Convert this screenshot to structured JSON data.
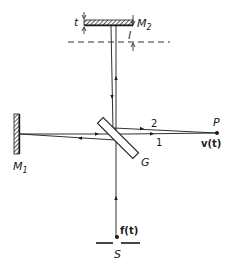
{
  "figure": {
    "type": "michelson-interferometer",
    "colors": {
      "ink": "#1a1a1a",
      "background": "#ffffff"
    }
  },
  "labels": {
    "mirror2": "M",
    "mirror2_sub": "2",
    "mirror1": "M",
    "mirror1_sub": "1",
    "beamsplitter": "G",
    "displacement_t": "t",
    "path_offset_l": "l",
    "point_p": "P",
    "output_signal": "v(t)",
    "beam2": "2",
    "beam1": "1",
    "source": "S",
    "input_signal": "f(t)"
  }
}
